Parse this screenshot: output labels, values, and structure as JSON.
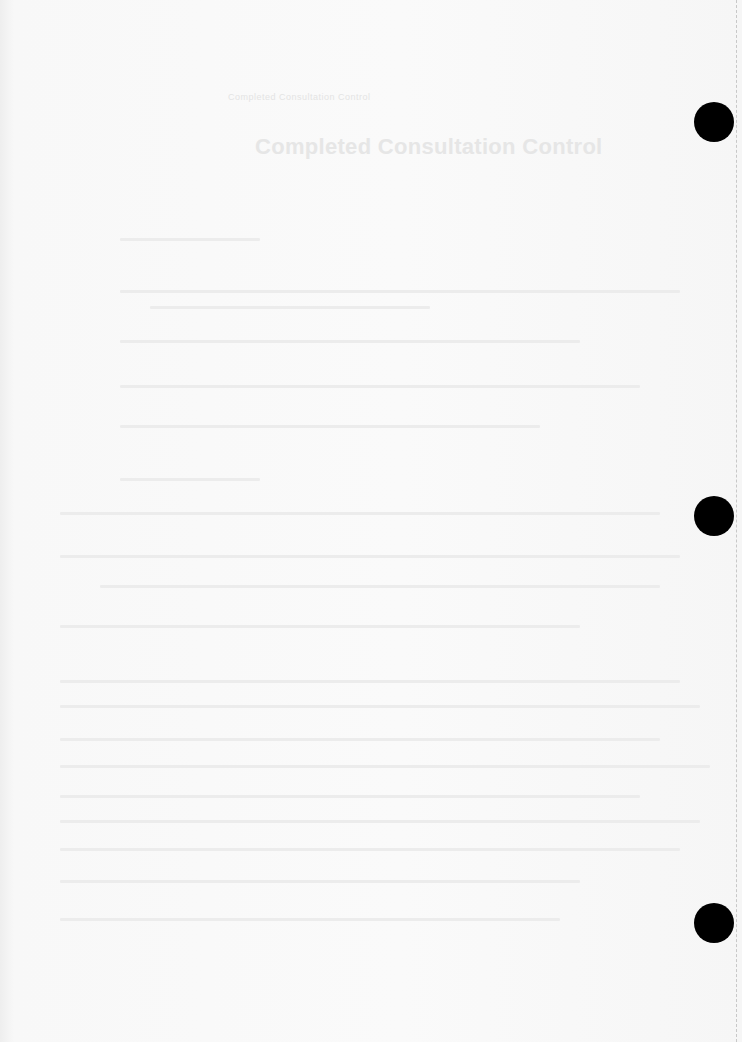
{
  "document": {
    "header_text": "Completed Consultation Control",
    "title": "Completed Consultation Control",
    "legibility": "faded scan - body text not legible"
  },
  "ghost_lines": [
    {
      "x": 120,
      "y": 238,
      "w": 140
    },
    {
      "x": 120,
      "y": 290,
      "w": 560
    },
    {
      "x": 150,
      "y": 306,
      "w": 280
    },
    {
      "x": 120,
      "y": 340,
      "w": 460
    },
    {
      "x": 120,
      "y": 385,
      "w": 520
    },
    {
      "x": 120,
      "y": 425,
      "w": 420
    },
    {
      "x": 120,
      "y": 478,
      "w": 140
    },
    {
      "x": 60,
      "y": 512,
      "w": 600
    },
    {
      "x": 60,
      "y": 555,
      "w": 620
    },
    {
      "x": 100,
      "y": 585,
      "w": 560
    },
    {
      "x": 60,
      "y": 625,
      "w": 520
    },
    {
      "x": 60,
      "y": 680,
      "w": 620
    },
    {
      "x": 60,
      "y": 705,
      "w": 640
    },
    {
      "x": 60,
      "y": 738,
      "w": 600
    },
    {
      "x": 60,
      "y": 765,
      "w": 650
    },
    {
      "x": 60,
      "y": 795,
      "w": 580
    },
    {
      "x": 60,
      "y": 820,
      "w": 640
    },
    {
      "x": 60,
      "y": 848,
      "w": 620
    },
    {
      "x": 60,
      "y": 880,
      "w": 520
    },
    {
      "x": 60,
      "y": 918,
      "w": 500
    }
  ],
  "punch_holes": [
    {
      "x": 694,
      "y": 102
    },
    {
      "x": 694,
      "y": 496
    },
    {
      "x": 694,
      "y": 903
    }
  ]
}
